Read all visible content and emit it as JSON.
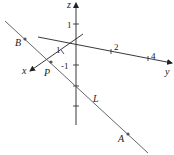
{
  "diagram": {
    "axes": {
      "x_label": "x",
      "y_label": "y",
      "z_label": "z"
    },
    "ticks": {
      "z_pos": "1",
      "z_neg": "-1",
      "x_one": "1",
      "y_two": "2",
      "y_four": "4"
    },
    "points": {
      "A": "A",
      "B": "B",
      "P": "P"
    },
    "line_label": "L",
    "colors": {
      "axis": "#222222",
      "line": "#555555",
      "point": "#555555"
    }
  }
}
